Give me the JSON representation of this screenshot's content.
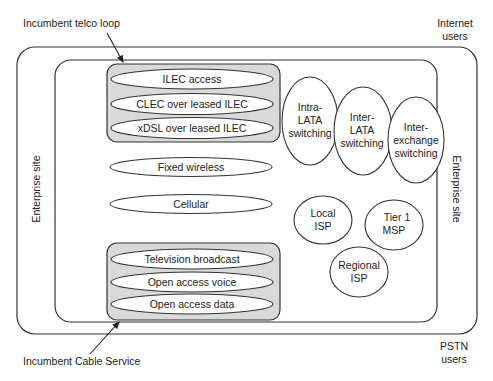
{
  "diagram": {
    "annotations": {
      "telco_loop": "Incumbent telco loop",
      "cable_service": "Incumbent Cable Service",
      "internet_users": [
        "Internet",
        "users"
      ],
      "pstn_users": [
        "PSTN",
        "users"
      ],
      "enterprise_site_left": "Enterprise site",
      "enterprise_site_right": "Enterprise site"
    },
    "telco_group": {
      "items": [
        "ILEC access",
        "CLEC over leased ILEC",
        "xDSL over leased ILEC"
      ]
    },
    "wireless": {
      "items": [
        "Fixed wireless",
        "Cellular"
      ]
    },
    "cable_group": {
      "items": [
        "Television broadcast",
        "Open access voice",
        "Open access data"
      ]
    },
    "switching": [
      {
        "lines": [
          "Intra-",
          "LATA",
          "switching"
        ]
      },
      {
        "lines": [
          "Inter-",
          "LATA",
          "switching"
        ]
      },
      {
        "lines": [
          "Inter-",
          "exchange",
          "switching"
        ]
      }
    ],
    "providers": [
      {
        "lines": [
          "Local",
          "ISP"
        ]
      },
      {
        "lines": [
          "Tier 1",
          "MSP"
        ]
      },
      {
        "lines": [
          "Regional",
          "ISP"
        ]
      }
    ],
    "colors": {
      "group_fill": "#d9d9d9",
      "stroke": "#333333",
      "background": "#ffffff"
    }
  }
}
